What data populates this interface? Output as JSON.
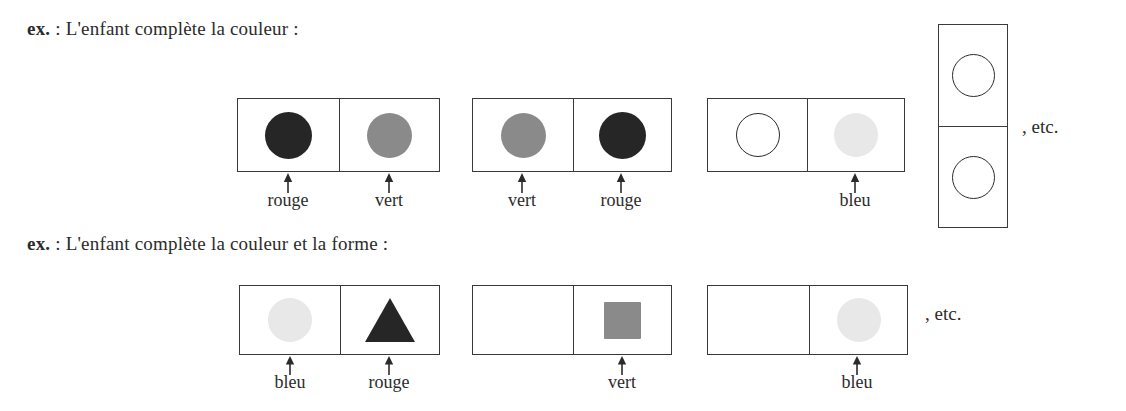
{
  "document": {
    "language": "fr",
    "background_color": "#ffffff",
    "ink_color": "#2b2b2b"
  },
  "palette": {
    "rouge": "#262626",
    "vert": "#8a8a8a",
    "bleu": "#e8e8e8",
    "outline": "#2a2a2a",
    "box_border": "#3a3a3a"
  },
  "exercises": [
    {
      "id": "exercise-color",
      "prompt_prefix": "ex.",
      "prompt_text": " : L'enfant complète la couleur :",
      "trailing_note": ", etc.",
      "pairs": [
        {
          "id": "pair-1",
          "cells": [
            {
              "shape": "circle-filled",
              "color_name": "rouge",
              "color": "#262626",
              "label": "rouge"
            },
            {
              "shape": "circle-filled",
              "color_name": "vert",
              "color": "#8a8a8a",
              "label": "vert"
            }
          ]
        },
        {
          "id": "pair-2",
          "cells": [
            {
              "shape": "circle-filled",
              "color_name": "vert",
              "color": "#8a8a8a",
              "label": "vert"
            },
            {
              "shape": "circle-filled",
              "color_name": "rouge",
              "color": "#262626",
              "label": "rouge"
            }
          ]
        },
        {
          "id": "pair-3",
          "cells": [
            {
              "shape": "circle-outline",
              "color_name": "blanc",
              "color": "#ffffff",
              "label": ""
            },
            {
              "shape": "circle-filled",
              "color_name": "bleu",
              "color": "#e8e8e8",
              "label": "bleu"
            }
          ]
        }
      ],
      "vertical_stack": {
        "id": "vertical-pair",
        "cells": [
          {
            "shape": "circle-outline",
            "color_name": "blanc",
            "color": "#ffffff",
            "label": ""
          },
          {
            "shape": "circle-outline",
            "color_name": "blanc",
            "color": "#ffffff",
            "label": ""
          }
        ]
      }
    },
    {
      "id": "exercise-color-shape",
      "prompt_prefix": "ex.",
      "prompt_text": " : L'enfant complète la couleur et la forme :",
      "trailing_note": ", etc.",
      "pairs": [
        {
          "id": "pair-1",
          "cells": [
            {
              "shape": "circle-filled",
              "color_name": "bleu",
              "color": "#e8e8e8",
              "label": "bleu"
            },
            {
              "shape": "triangle-filled",
              "color_name": "rouge",
              "color": "#262626",
              "label": "rouge"
            }
          ]
        },
        {
          "id": "pair-2",
          "cells": [
            {
              "shape": "empty",
              "color_name": "",
              "color": "#ffffff",
              "label": ""
            },
            {
              "shape": "square-filled",
              "color_name": "vert",
              "color": "#8a8a8a",
              "label": "vert"
            }
          ]
        },
        {
          "id": "pair-3",
          "cells": [
            {
              "shape": "empty",
              "color_name": "",
              "color": "#ffffff",
              "label": ""
            },
            {
              "shape": "circle-filled",
              "color_name": "bleu",
              "color": "#e8e8e8",
              "label": "bleu"
            }
          ]
        }
      ]
    }
  ]
}
